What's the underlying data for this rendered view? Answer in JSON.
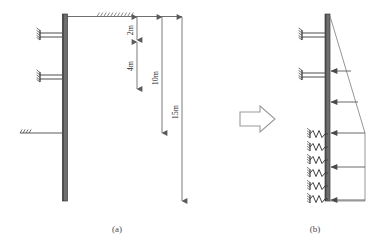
{
  "figure": {
    "title_hidden": "",
    "panels": [
      {
        "id": "panel-a",
        "caption": "(a)",
        "description": "Retaining wall with struts and dimension lines"
      },
      {
        "id": "panel-b",
        "caption": "(b)",
        "description": "Equivalent model with springs and earth pressure distribution"
      }
    ],
    "transition_icon": "right-arrow-icon"
  },
  "dimensions": {
    "items": [
      {
        "key": "d1",
        "label": "2m",
        "value": 2,
        "unit": "m"
      },
      {
        "key": "d2",
        "label": "4m",
        "value": 4,
        "unit": "m"
      },
      {
        "key": "d3",
        "label": "10m",
        "value": 10,
        "unit": "m"
      },
      {
        "key": "d4",
        "label": "15m",
        "value": 15,
        "unit": "m"
      }
    ]
  },
  "panel_a": {
    "wall": {
      "top_m": 0,
      "bottom_m": 15,
      "label": "diaphragm-wall"
    },
    "ground_surface": {
      "label": "ground-surface-hatch",
      "depth_m": 0
    },
    "struts": [
      {
        "index": 1,
        "depth_m": 2,
        "label": "strut-level-1"
      },
      {
        "index": 2,
        "depth_m": 6,
        "label": "strut-level-2"
      }
    ],
    "excavation_level": {
      "depth_m": 10,
      "label": "excavation-base-line"
    }
  },
  "panel_b": {
    "wall": {
      "label": "diaphragm-wall"
    },
    "struts": [
      {
        "index": 1,
        "label": "strut-level-1"
      },
      {
        "index": 2,
        "label": "strut-level-2"
      }
    ],
    "springs": {
      "count": 6,
      "label": "soil-spring"
    },
    "pressure_loads": {
      "count": 5,
      "label": "earth-pressure-arrow"
    },
    "pressure_profile": {
      "shape": "triangular-then-rectangular"
    }
  },
  "colors": {
    "wall": "#6e6e6e",
    "wall_edge": "#3c3c3c",
    "line": "#777777",
    "dim_line": "#6b6b6b",
    "text": "#2b2b2b",
    "caption": "#4a4a4a",
    "arrow_outline": "#9a9a9a",
    "background": "#ffffff"
  }
}
